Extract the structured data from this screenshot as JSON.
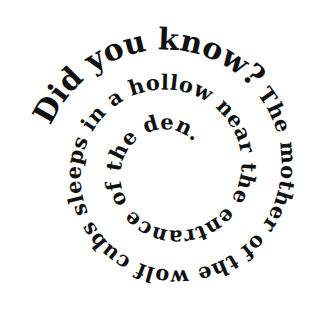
{
  "image": {
    "background": "#ffffff",
    "text_color": "#111111",
    "full_text": "Did you know? The mother of the wolf cubs sleeps in a hollow near the entrance of the den."
  },
  "spiral": {
    "center_x": 171,
    "center_y": 170,
    "start_angle_deg": 200,
    "start_radius": 128,
    "radius_drop_per_turn": 40,
    "turns": 2.9
  },
  "segments": [
    {
      "id": "lead",
      "text": "Did you know?",
      "size": "large",
      "offset": "0%"
    },
    {
      "id": "body",
      "text": "The mother of the wolf cubs sleeps in a hollow near the entrance of the den.",
      "size": "mid",
      "offset": "19.6%"
    }
  ]
}
